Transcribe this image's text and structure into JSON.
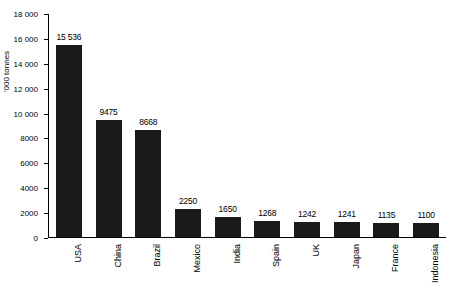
{
  "chart_data": {
    "type": "bar",
    "title": "",
    "xlabel": "",
    "ylabel": "'000 tonnes",
    "ylim": [
      0,
      18000
    ],
    "yticks": [
      "0",
      "2000",
      "4000",
      "6000",
      "8000",
      "10 000",
      "12 000",
      "14 000",
      "16 000",
      "18 000"
    ],
    "ytick_values": [
      0,
      2000,
      4000,
      6000,
      8000,
      10000,
      12000,
      14000,
      16000,
      18000
    ],
    "grid": false,
    "legend": "none",
    "categories": [
      "USA",
      "China",
      "Brazil",
      "Mexico",
      "India",
      "Spain",
      "UK",
      "Japan",
      "France",
      "Indonesia"
    ],
    "values": [
      15536,
      9475,
      8668,
      2250,
      1650,
      1268,
      1242,
      1241,
      1135,
      1100
    ],
    "value_labels": [
      "15 536",
      "9475",
      "8668",
      "2250",
      "1650",
      "1268",
      "1242",
      "1241",
      "1135",
      "1100"
    ],
    "bar_color": "#1a1a1a"
  }
}
